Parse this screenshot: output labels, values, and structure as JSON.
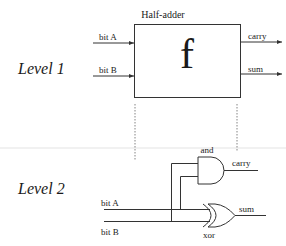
{
  "diagram": {
    "title": "Half-adder",
    "levels": [
      {
        "label": "Level 1"
      },
      {
        "label": "Level 2"
      }
    ],
    "level1": {
      "block_title": "Half-adder",
      "block_symbol": "f",
      "inputs": [
        "bit A",
        "bit B"
      ],
      "outputs": [
        "carry",
        "sum"
      ]
    },
    "level2": {
      "inputs": [
        "bit A",
        "bit B"
      ],
      "gates": [
        {
          "type": "and",
          "label": "and",
          "output": "carry"
        },
        {
          "type": "xor",
          "label": "xor",
          "output": "sum"
        }
      ]
    },
    "colors": {
      "line": "#333333",
      "text": "#1a1a1a",
      "divider": "#e8e8e8",
      "background": "#ffffff"
    }
  }
}
